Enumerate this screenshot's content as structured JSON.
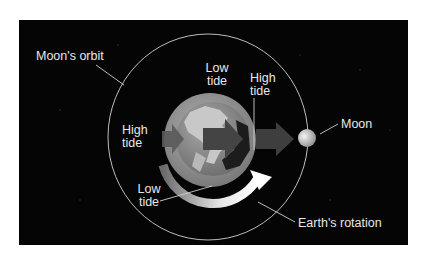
{
  "diagram": {
    "labels": {
      "moons_orbit": "Moon's orbit",
      "low_tide_top": [
        "Low",
        "tide"
      ],
      "high_tide_right": [
        "High",
        "tide"
      ],
      "high_tide_left": [
        "High",
        "tide"
      ],
      "low_tide_bottom": [
        "Low",
        "tide"
      ],
      "moon": "Moon",
      "earths_rotation": "Earth's rotation"
    },
    "icons": {
      "earth": "earth-globe",
      "moon": "moon-sphere",
      "gravity_arrows": "arrow-right",
      "rotation_arrow": "curved-arrow-clockwise"
    },
    "colors": {
      "background": "#050505",
      "page": "#ffffff",
      "label_text": "#e8e8e8",
      "orbit_line": "#bdbdbd",
      "earth_bulge": "#9a9a9a",
      "earth_land": "#c8c8c8",
      "arrow": "#4a4a4a",
      "rotation_arrow": "#f2f2f2"
    }
  }
}
